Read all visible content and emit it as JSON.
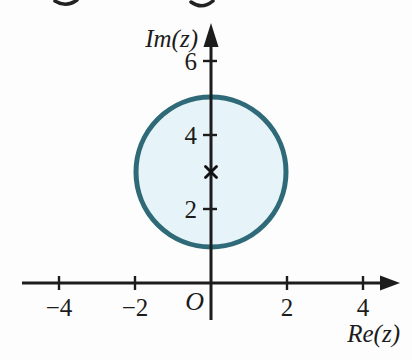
{
  "figure": {
    "background_color": "#fdfdfd",
    "axis_color": "#1c1c1c",
    "x_axis": {
      "label": "Re(z)",
      "ticks": [
        {
          "value": -4,
          "label": "−4"
        },
        {
          "value": -2,
          "label": "−2"
        },
        {
          "value": 2,
          "label": "2"
        },
        {
          "value": 4,
          "label": "4"
        }
      ]
    },
    "y_axis": {
      "label": "Im(z)",
      "ticks": [
        {
          "value": 2,
          "label": "2"
        },
        {
          "value": 4,
          "label": "4"
        },
        {
          "value": 6,
          "label": "6"
        }
      ]
    },
    "origin_label": "O",
    "region": {
      "shape": "circle",
      "center": {
        "re": 0,
        "im": 3
      },
      "radius": 2,
      "fill_color": "#e6f3f8",
      "stroke_color": "#2e6a77",
      "center_marker": "cross",
      "marker_color": "#111111"
    }
  }
}
